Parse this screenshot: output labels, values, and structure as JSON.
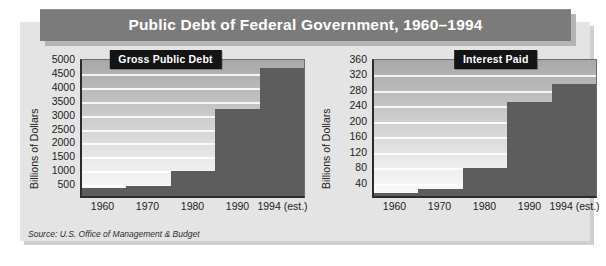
{
  "figure": {
    "banner_title": "Public Debt of Federal Government, 1960–1994",
    "source_note": "Source: U.S. Office of Management & Budget",
    "colors": {
      "banner_bg": "#7b7b7b",
      "banner_text": "#ffffff",
      "panel_bg": "#e4e4e4",
      "bar_fill": "#5d5d5d",
      "plaque_bg": "#141414",
      "plot_top": "#a9a9a9",
      "plot_bottom": "#fbfbfb",
      "gridline": "#ffffff",
      "axis": "#2b2b2b"
    }
  },
  "chart_data": [
    {
      "id": "gross-public-debt",
      "type": "bar",
      "title": "Gross Public Debt",
      "xlabel": "",
      "ylabel": "Billions of Dollars",
      "categories": [
        "1960",
        "1970",
        "1980",
        "1990",
        "1994 (est.)"
      ],
      "values": [
        290,
        380,
        910,
        3210,
        4690
      ],
      "yticks": [
        500,
        1000,
        1500,
        2000,
        2500,
        3000,
        3500,
        4000,
        4500,
        5000
      ],
      "ylim": [
        0,
        5000
      ],
      "grid": true,
      "legend": "none"
    },
    {
      "id": "interest-paid",
      "type": "bar",
      "title": "Interest Paid",
      "xlabel": "",
      "ylabel": "Billions of Dollars",
      "categories": [
        "1960",
        "1970",
        "1980",
        "1990",
        "1994 (est.)"
      ],
      "values": [
        9,
        19,
        75,
        250,
        296
      ],
      "yticks": [
        40,
        80,
        120,
        160,
        200,
        240,
        280,
        320,
        360
      ],
      "ylim": [
        0,
        360
      ],
      "grid": true,
      "legend": "none"
    }
  ]
}
